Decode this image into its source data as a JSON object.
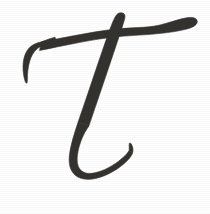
{
  "image": {
    "kind": "handwritten-glyph-scan",
    "title": "Greek small letter tau",
    "character": "τ",
    "character_name": "tau",
    "alphabet": "Greek",
    "case": "lowercase",
    "style": "cursive calligraphic brush ink",
    "medium": "ink on paper",
    "width": 210,
    "height": 214,
    "alt_text": "Handwritten cursive Greek lowercase letter tau in dark charcoal ink on a white background"
  },
  "colors": {
    "background": "#ffffff",
    "ink": "#34322f",
    "ink_edge": "#5a5754",
    "paper_shadow": "#f3f3f3"
  },
  "strokes": [
    {
      "name": "horizontal-bar",
      "description": "Long horizontal top bar sweeping left to right, tapering at the right tip",
      "start": [
        196,
        23
      ],
      "end": [
        30,
        42
      ]
    },
    {
      "name": "left-hook",
      "description": "Downward curving hook terminating in a sharp point at the left end of the bar",
      "start": [
        40,
        34
      ],
      "end": [
        25,
        80
      ]
    },
    {
      "name": "descender-stroke",
      "description": "Diagonal stroke descending from the bar crossing down and left, thickening as it falls",
      "start": [
        120,
        14
      ],
      "end": [
        68,
        160
      ]
    },
    {
      "name": "bottom-bowl-tail",
      "description": "Swooping bowl at the base curving right and rising to a thin tapered tail",
      "start": [
        68,
        160
      ],
      "end": [
        131,
        143
      ]
    }
  ]
}
